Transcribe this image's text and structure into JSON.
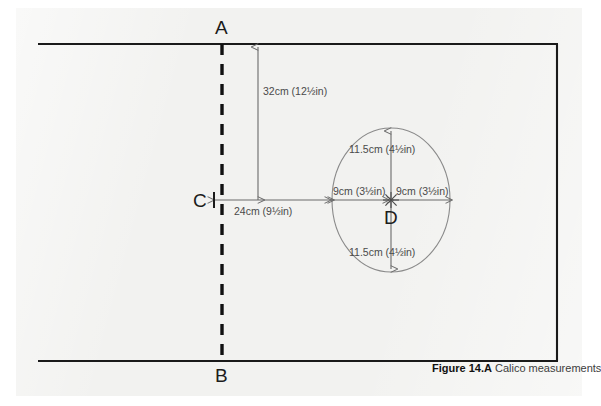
{
  "figure": {
    "caption_label": "Figure 14.A",
    "caption_text": "Calico measurements"
  },
  "points": {
    "a": "A",
    "b": "B",
    "c": "C",
    "d": "D"
  },
  "dimensions": {
    "vertical_top": "32cm (12½in)",
    "horizontal_left": "24cm (9½in)",
    "radius_left": "9cm (3½in)",
    "radius_right": "9cm (3½in)",
    "radius_up": "11.5cm (4½in)",
    "radius_down": "11.5cm (4½in)"
  },
  "colors": {
    "panel": "#f2f2f0",
    "rule": "#1a1a1a",
    "dash": "#111111",
    "dimension": "#6b6b6b",
    "ellipse": "#8a8a8a",
    "text": "#4a4a4a"
  }
}
